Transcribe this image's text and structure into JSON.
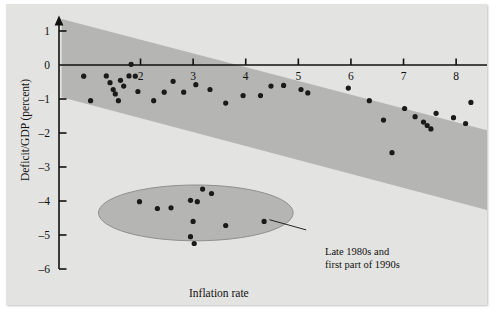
{
  "chart_data": {
    "type": "scatter",
    "title": "",
    "xlabel": "Inflation rate",
    "ylabel": "Deficit/GDP (percent)",
    "xlim": [
      0.45,
      9.4
    ],
    "ylim": [
      -6,
      1.4
    ],
    "xticks": [
      2,
      3,
      4,
      5,
      6,
      7,
      8,
      9
    ],
    "yticks": [
      1,
      0,
      -1,
      -2,
      -3,
      -4,
      -5,
      -6
    ],
    "xtick_labels": [
      "2",
      "3",
      "4",
      "5",
      "6",
      "7",
      "8",
      "9"
    ],
    "ytick_labels": [
      "1",
      "0",
      "–1",
      "–2",
      "–3",
      "–4",
      "–5",
      "–6"
    ],
    "grid": false,
    "legend": null,
    "axis_arrows": true,
    "point_color": "#1a1a1a",
    "point_radius": 2.6,
    "band": {
      "name": "trend band",
      "color": "#b5b5b3",
      "upper_left": [
        0.5,
        1.35
      ],
      "upper_right": [
        9.4,
        -2.25
      ],
      "lower_left": [
        0.5,
        -0.95
      ],
      "lower_right": [
        9.4,
        -4.6
      ]
    },
    "ellipse": {
      "name": "Late 1980s and first part of 1990s cluster",
      "color": "#b5b5b3",
      "center_x": 3.05,
      "center_y": -4.35,
      "radius_x": 1.85,
      "radius_y": 0.82
    },
    "annotation": {
      "line1": "Late 1980s and",
      "line2": "first part of 1990s",
      "leader_from": [
        4.45,
        -4.55
      ],
      "leader_to": [
        5.15,
        -4.85
      ]
    },
    "points": [
      [
        0.92,
        -0.33
      ],
      [
        1.05,
        -1.05
      ],
      [
        1.35,
        -0.32
      ],
      [
        1.42,
        -0.52
      ],
      [
        1.48,
        -0.72
      ],
      [
        1.52,
        -0.85
      ],
      [
        1.58,
        -1.05
      ],
      [
        1.62,
        -0.45
      ],
      [
        1.68,
        -0.62
      ],
      [
        1.78,
        -0.32
      ],
      [
        1.82,
        0.02
      ],
      [
        1.9,
        -0.33
      ],
      [
        1.95,
        -0.78
      ],
      [
        2.25,
        -1.05
      ],
      [
        2.45,
        -0.8
      ],
      [
        2.62,
        -0.48
      ],
      [
        2.82,
        -0.8
      ],
      [
        3.05,
        -0.58
      ],
      [
        3.32,
        -0.72
      ],
      [
        3.62,
        -1.12
      ],
      [
        3.95,
        -0.9
      ],
      [
        4.28,
        -0.9
      ],
      [
        4.48,
        -0.62
      ],
      [
        4.72,
        -0.6
      ],
      [
        5.05,
        -0.72
      ],
      [
        5.18,
        -0.82
      ],
      [
        5.95,
        -0.68
      ],
      [
        6.35,
        -1.05
      ],
      [
        6.62,
        -1.62
      ],
      [
        6.78,
        -2.58
      ],
      [
        7.02,
        -1.28
      ],
      [
        7.22,
        -1.52
      ],
      [
        7.38,
        -1.68
      ],
      [
        7.45,
        -1.78
      ],
      [
        7.52,
        -1.88
      ],
      [
        7.62,
        -1.42
      ],
      [
        7.95,
        -1.55
      ],
      [
        8.18,
        -1.72
      ],
      [
        8.28,
        -1.1
      ],
      [
        1.98,
        -4.02
      ],
      [
        2.32,
        -4.22
      ],
      [
        2.58,
        -4.2
      ],
      [
        2.95,
        -3.98
      ],
      [
        3.08,
        -4.02
      ],
      [
        3.18,
        -3.65
      ],
      [
        3.35,
        -3.78
      ],
      [
        3.0,
        -4.6
      ],
      [
        2.95,
        -5.05
      ],
      [
        3.02,
        -5.25
      ],
      [
        3.62,
        -4.72
      ],
      [
        4.35,
        -4.6
      ]
    ]
  },
  "figure": {
    "background": "#e3e3e1",
    "axis_color": "#111111"
  }
}
